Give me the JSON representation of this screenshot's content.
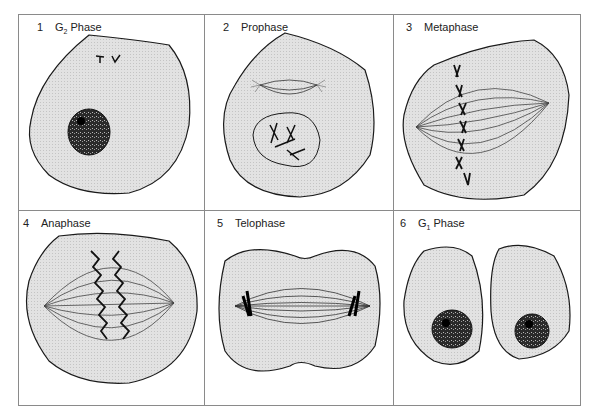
{
  "figure": {
    "panels": [
      {
        "number": "1",
        "name_prefix": "G",
        "name_sub": "2",
        "name_suffix": " Phase"
      },
      {
        "number": "2",
        "name": "Prophase"
      },
      {
        "number": "3",
        "name": "Metaphase"
      },
      {
        "number": "4",
        "name": "Anaphase"
      },
      {
        "number": "5",
        "name": "Telophase"
      },
      {
        "number": "6",
        "name_prefix": "G",
        "name_sub": "1",
        "name_suffix": " Phase"
      }
    ]
  },
  "colors": {
    "cytoplasm": "#dcdcdc",
    "outline": "#1a1a1a",
    "nucleus": "#3a3a3a",
    "grid": "#8a8a8a"
  }
}
